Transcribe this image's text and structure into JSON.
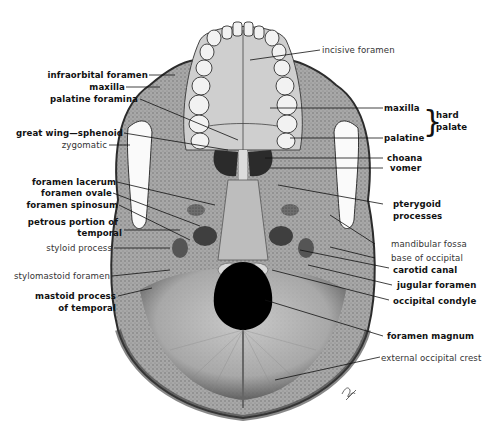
{
  "figure": {
    "artist_signature": "signature mark"
  },
  "labels_left": [
    {
      "id": "infraorbital-foramen",
      "text": "infraorbital foramen",
      "weight": "bold"
    },
    {
      "id": "maxilla-left",
      "text": "maxilla",
      "weight": "bold"
    },
    {
      "id": "palatine-foramina",
      "text": "palatine foramina",
      "weight": "bold"
    },
    {
      "id": "great-wing-sphenoid",
      "text": "great wing—sphenoid",
      "weight": "bold"
    },
    {
      "id": "zygomatic",
      "text": "zygomatic",
      "weight": "light"
    },
    {
      "id": "foramen-lacerum",
      "text": "foramen lacerum",
      "weight": "bold"
    },
    {
      "id": "foramen-ovale",
      "text": "foramen ovale",
      "weight": "bold"
    },
    {
      "id": "foramen-spinosum",
      "text": "foramen spinosum",
      "weight": "bold"
    },
    {
      "id": "petrous-portion-1",
      "text": "petrous portion of",
      "weight": "bold"
    },
    {
      "id": "petrous-portion-2",
      "text": "temporal",
      "weight": "bold"
    },
    {
      "id": "styloid-process",
      "text": "styloid process",
      "weight": "light"
    },
    {
      "id": "stylomastoid-foramen",
      "text": "stylomastoid foramen",
      "weight": "light"
    },
    {
      "id": "mastoid-process-1",
      "text": "mastoid process",
      "weight": "bold"
    },
    {
      "id": "mastoid-process-2",
      "text": "of temporal",
      "weight": "bold"
    }
  ],
  "labels_right": [
    {
      "id": "incisive-foramen",
      "text": "incisive foramen",
      "weight": "light"
    },
    {
      "id": "maxilla-right",
      "text": "maxilla",
      "weight": "bold"
    },
    {
      "id": "palatine",
      "text": "palatine",
      "weight": "bold"
    },
    {
      "id": "hard-palate-1",
      "text": "hard",
      "weight": "bold"
    },
    {
      "id": "hard-palate-2",
      "text": "palate",
      "weight": "bold"
    },
    {
      "id": "choana",
      "text": "choana",
      "weight": "bold"
    },
    {
      "id": "vomer",
      "text": "vomer",
      "weight": "bold"
    },
    {
      "id": "pterygoid-1",
      "text": "pterygoid",
      "weight": "bold"
    },
    {
      "id": "pterygoid-2",
      "text": "processes",
      "weight": "bold"
    },
    {
      "id": "mandibular-fossa",
      "text": "mandibular fossa",
      "weight": "light"
    },
    {
      "id": "base-of-occipital",
      "text": "base of occipital",
      "weight": "light"
    },
    {
      "id": "carotid-canal",
      "text": "carotid canal",
      "weight": "bold"
    },
    {
      "id": "jugular-foramen",
      "text": "jugular foramen",
      "weight": "bold"
    },
    {
      "id": "occipital-condyle",
      "text": "occipital condyle",
      "weight": "bold"
    },
    {
      "id": "foramen-magnum",
      "text": "foramen magnum",
      "weight": "bold"
    },
    {
      "id": "external-occipital-crest",
      "text": "external occipital crest",
      "weight": "light"
    }
  ],
  "colors": {
    "background": "#ffffff",
    "bone_light": "#c9c9c9",
    "bone_mid": "#8f8f8f",
    "bone_dark": "#4a4a4a",
    "teeth": "#f2f2f2",
    "foramen": "#000000",
    "leader_line": "#111111"
  }
}
